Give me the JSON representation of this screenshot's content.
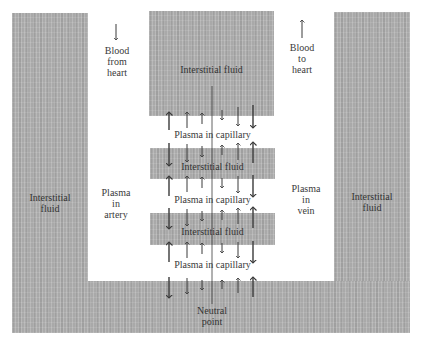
{
  "diagram": {
    "colors": {
      "interstitial_fluid": "#a9a9a9",
      "plasma": "#ffffff",
      "text": "#3a3a3a",
      "arrow": "#3a3a3a"
    },
    "labels": {
      "blood_from_heart": [
        "Blood",
        "from",
        "heart"
      ],
      "blood_to_heart": [
        "Blood",
        "to",
        "heart"
      ],
      "left_fluid": [
        "Interstitial",
        "fluid"
      ],
      "right_fluid": [
        "Interstitial",
        "fluid"
      ],
      "plasma_artery": [
        "Plasma",
        "in",
        "artery"
      ],
      "plasma_vein": [
        "Plasma",
        "in",
        "vein"
      ],
      "top_block": "Interstitial fluid",
      "middle_block": "Interstitial fluid",
      "lower_block": "Interstitial fluid",
      "capillary_1": "Plasma in capillary",
      "capillary_2": "Plasma in capillary",
      "capillary_3": "Plasma in capillary",
      "neutral_point": [
        "Neutral",
        "point"
      ]
    },
    "flow_arrows": {
      "blood_from_heart": "down",
      "blood_to_heart": "up"
    },
    "exchange_note": "Arterial end: arrows out of plasma (filtration); venous end: arrows into plasma (reabsorption); neutral point in middle"
  }
}
